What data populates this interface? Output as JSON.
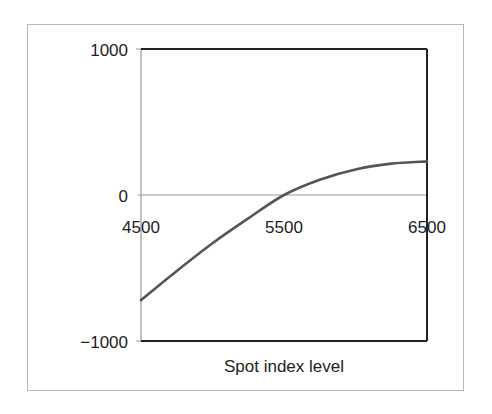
{
  "chart_data": {
    "type": "line",
    "title": "",
    "xlabel": "Spot index level",
    "ylabel": "",
    "xlim": [
      4500,
      6500
    ],
    "ylim": [
      -1000,
      1000
    ],
    "x_ticks": [
      "4500",
      "5500",
      "6500"
    ],
    "y_ticks": [
      "1000",
      "0",
      "−1000"
    ],
    "grid": false,
    "legend": null,
    "series": [
      {
        "name": "Payoff",
        "color": "#555555",
        "x": [
          4500,
          4750,
          5000,
          5250,
          5500,
          5750,
          6000,
          6250,
          6500
        ],
        "values": [
          -720,
          -520,
          -330,
          -160,
          0,
          105,
          175,
          215,
          230
        ]
      }
    ]
  },
  "labels": {
    "xaxis_title": "Spot index level",
    "ytick_top": "1000",
    "ytick_mid": "0",
    "ytick_bottom": "−1000",
    "xtick_left": "4500",
    "xtick_mid": "5500",
    "xtick_right": "6500"
  }
}
